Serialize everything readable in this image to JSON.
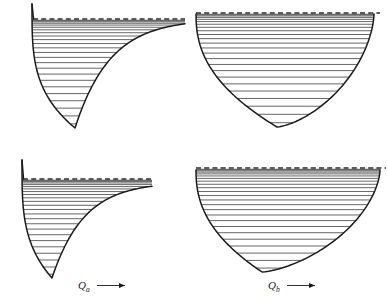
{
  "figure": {
    "background_color": "#ffffff",
    "curve_color": "#1a1a1a",
    "level_color": "#4a4a4a",
    "dissociation_color": "#2a2a2a",
    "width": 388,
    "height": 302,
    "panel_count": 4
  },
  "axis_labels": [
    {
      "id": "qa",
      "symbol": "Q",
      "subscript": "a",
      "arrow": "⟶",
      "x": 78,
      "y": 289
    },
    {
      "id": "qb",
      "symbol": "Q",
      "subscript": "b",
      "arrow": "⟶",
      "x": 268,
      "y": 289
    }
  ],
  "chart_data": {
    "type": "line",
    "xlabel": "Normal coordinate Q",
    "ylabel": "Potential energy",
    "grid": false,
    "legend": false,
    "panels": [
      {
        "id": "top-left",
        "name": "anharmonic-well-top-left",
        "shape": "morse",
        "description": "Anharmonic Morse potential, steep left wall, shallow right asymptote reaching dissociation limit",
        "minimum": {
          "x": 75,
          "y": 128
        },
        "left_wall_top": {
          "x": 32,
          "y": 4
        },
        "right_asymptote": {
          "x": 185,
          "y": 19
        },
        "dissociation_level": {
          "y": 19,
          "x_start": 33,
          "x_end": 185
        },
        "level_count": 24,
        "levels_converge_upward": true
      },
      {
        "id": "top-right",
        "name": "harmonic-well-top-right",
        "shape": "symmetric",
        "description": "Near-symmetric well, both walls rise to the dissociation limit",
        "minimum": {
          "x": 277,
          "y": 127
        },
        "left_wall_top": {
          "x": 196,
          "y": 14
        },
        "right_wall_top": {
          "x": 374,
          "y": 14
        },
        "dissociation_level": {
          "y": 13,
          "x_start": 196,
          "x_end": 380
        },
        "level_count": 24,
        "levels_converge_upward": true
      },
      {
        "id": "bottom-left",
        "name": "anharmonic-well-bottom-left",
        "shape": "morse",
        "description": "Anharmonic Morse potential, steep left wall, shallow right asymptote reaching dissociation limit",
        "minimum": {
          "x": 52,
          "y": 278
        },
        "left_wall_top": {
          "x": 22,
          "y": 160
        },
        "right_asymptote": {
          "x": 152,
          "y": 182
        },
        "dissociation_level": {
          "y": 179,
          "x_start": 23,
          "x_end": 152
        },
        "level_count": 24,
        "levels_converge_upward": true
      },
      {
        "id": "bottom-right",
        "name": "harmonic-well-bottom-right",
        "shape": "symmetric",
        "description": "Near-symmetric well, both walls rise to the dissociation limit",
        "minimum": {
          "x": 262,
          "y": 272
        },
        "left_wall_top": {
          "x": 196,
          "y": 170
        },
        "right_wall_top": {
          "x": 380,
          "y": 170
        },
        "dissociation_level": {
          "y": 168,
          "x_start": 196,
          "x_end": 386
        },
        "level_count": 24,
        "levels_converge_upward": true
      }
    ]
  }
}
